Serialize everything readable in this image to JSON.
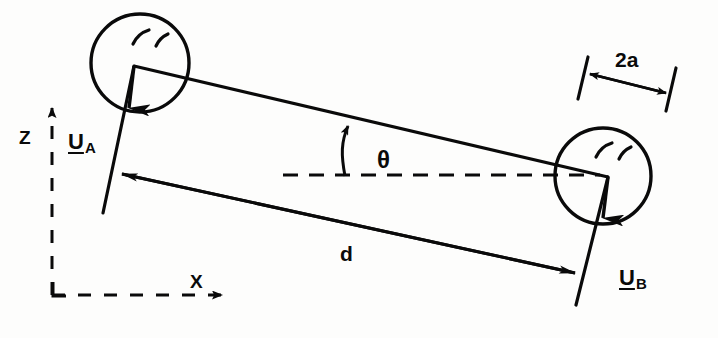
{
  "figure": {
    "background_color": "#fdfdfc",
    "ink_color": "#0a0a0a"
  },
  "axes": {
    "z_label": "Z",
    "x_label": "X",
    "style": "dashed"
  },
  "labels": {
    "velocity_a_symbol": "U",
    "velocity_a_subscript": "A",
    "velocity_b_symbol": "U",
    "velocity_b_subscript": "B",
    "separation": "d",
    "diameter": "2a",
    "angle": "θ"
  },
  "geometry": {
    "body_a": {
      "center_x": 140,
      "center_y": 63,
      "radius": 49
    },
    "body_b": {
      "center_x": 603,
      "center_y": 176,
      "radius": 48
    },
    "node_a": {
      "x": 134,
      "y": 66
    },
    "node_b": {
      "x": 608,
      "y": 177
    },
    "distance_line": {
      "x1": 115,
      "y1": 172,
      "x2": 580,
      "y2": 274
    },
    "horizontal_reference": {
      "x1": 283,
      "y1": 175,
      "x2": 600,
      "y2": 175
    },
    "angle_degrees": 13
  }
}
